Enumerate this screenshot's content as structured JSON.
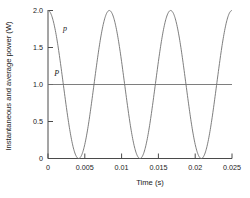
{
  "chart_data": {
    "type": "line",
    "title": "",
    "xlabel": "Time (s)",
    "ylabel": "Instantaneous and average power (W)",
    "xlim": [
      0,
      0.025
    ],
    "ylim": [
      0,
      2.0
    ],
    "grid": false,
    "legend": "none",
    "xticks": [
      "0",
      "0.005",
      "0.01",
      "0.015",
      "0.02",
      "0.025"
    ],
    "xtick_values": [
      0,
      0.005,
      0.01,
      0.015,
      0.02,
      0.025
    ],
    "yticks": [
      "0",
      "0.5",
      "1.0",
      "1.5",
      "2.0"
    ],
    "ytick_values": [
      0,
      0.5,
      1.0,
      1.5,
      2.0
    ],
    "series": [
      {
        "name": "p",
        "label": "p",
        "description": "instantaneous power, raised cosine",
        "color": "#6f6f6f",
        "form": "cosine",
        "amplitude": 1.0,
        "offset": 1.0,
        "period": 0.008333,
        "phase": 0.0,
        "peak": 2.0,
        "min": 0.0,
        "x": [
          0,
          0.001,
          0.002,
          0.003,
          0.004167,
          0.005,
          0.006,
          0.007,
          0.008333,
          0.009,
          0.01,
          0.011,
          0.0125,
          0.013,
          0.014,
          0.015,
          0.016667,
          0.018,
          0.019,
          0.02,
          0.020833,
          0.022,
          0.023,
          0.024,
          0.025
        ],
        "values": [
          2.0,
          1.73,
          1.0,
          0.27,
          0.0,
          0.27,
          1.0,
          1.73,
          2.0,
          1.79,
          1.25,
          0.5,
          0.0,
          0.13,
          0.66,
          1.37,
          2.0,
          1.5,
          0.83,
          0.23,
          0.0,
          0.66,
          1.37,
          1.88,
          2.0
        ]
      },
      {
        "name": "P",
        "label": "P",
        "description": "average power, constant",
        "color": "#6f6f6f",
        "form": "constant",
        "value": 1.0,
        "x": [
          0,
          0.025
        ],
        "values": [
          1.0,
          1.0
        ]
      }
    ],
    "annotations": [
      {
        "text": "p",
        "x": 0.0023,
        "y": 1.72,
        "name": "instantaneous-power-label"
      },
      {
        "text": "P",
        "x": 0.0012,
        "y": 1.12,
        "name": "average-power-label"
      }
    ]
  }
}
